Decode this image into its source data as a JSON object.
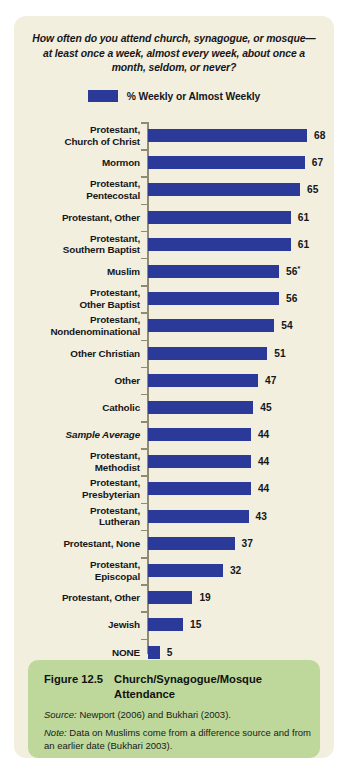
{
  "figure": {
    "question_title": "How often do you attend church, synagogue, or mosque—at least once a week, almost every week, about once a month, seldom, or never?",
    "legend_label": "% Weekly or Almost Weekly",
    "caption_number": "Figure 12.5",
    "caption_title": "Church/Synagogue/Mosque Attendance",
    "source_label": "Source:",
    "source_text": " Newport (2006) and Bukhari (2003).",
    "note_label": "Note:",
    "note_text": " Data on Muslims come from a difference source and from an earlier date (Bukhari 2003)."
  },
  "colors": {
    "bar": "#2b3a99",
    "card_background": "#f2efdf",
    "caption_background": "#bdd89a",
    "axis": "#8e8a73",
    "text": "#16161a"
  },
  "chart_data": {
    "type": "bar",
    "orientation": "horizontal",
    "title": "How often do you attend church, synagogue, or mosque—at least once a week, almost every week, about once a month, seldom, or never?",
    "xlabel": "",
    "ylabel": "",
    "xlim": [
      0,
      70
    ],
    "grid": false,
    "legend_position": "top-center",
    "series": [
      {
        "name": "% Weekly or Almost Weekly",
        "color": "#2b3a99",
        "values": [
          68,
          67,
          65,
          61,
          61,
          56,
          56,
          54,
          51,
          47,
          45,
          44,
          44,
          44,
          43,
          37,
          32,
          19,
          15,
          5
        ]
      }
    ],
    "categories": [
      "Protestant, Church of Christ",
      "Mormon",
      "Protestant, Pentecostal",
      "Protestant, Other",
      "Protestant, Southern Baptist",
      "Muslim",
      "Protestant, Other Baptist",
      "Protestant, Nondenominational",
      "Other Christian",
      "Other",
      "Catholic",
      "Sample Average",
      "Protestant, Methodist",
      "Protestant, Presbyterian",
      "Protestant, Lutheran",
      "Protestant, None",
      "Protestant, Episcopal",
      "Protestant, Other",
      "Jewish",
      "NONE"
    ],
    "rows": [
      {
        "label_line1": "Protestant,",
        "label_line2": "Church of Christ",
        "value": 68,
        "value_text": "68",
        "footnote": "",
        "italic": false
      },
      {
        "label_line1": "Mormon",
        "label_line2": "",
        "value": 67,
        "value_text": "67",
        "footnote": "",
        "italic": false
      },
      {
        "label_line1": "Protestant,",
        "label_line2": "Pentecostal",
        "value": 65,
        "value_text": "65",
        "footnote": "",
        "italic": false
      },
      {
        "label_line1": "Protestant, Other",
        "label_line2": "",
        "value": 61,
        "value_text": "61",
        "footnote": "",
        "italic": false
      },
      {
        "label_line1": "Protestant,",
        "label_line2": "Southern Baptist",
        "value": 61,
        "value_text": "61",
        "footnote": "",
        "italic": false
      },
      {
        "label_line1": "Muslim",
        "label_line2": "",
        "value": 56,
        "value_text": "56",
        "footnote": "*",
        "italic": false
      },
      {
        "label_line1": "Protestant,",
        "label_line2": "Other Baptist",
        "value": 56,
        "value_text": "56",
        "footnote": "",
        "italic": false
      },
      {
        "label_line1": "Protestant,",
        "label_line2": "Nondenominational",
        "value": 54,
        "value_text": "54",
        "footnote": "",
        "italic": false
      },
      {
        "label_line1": "Other Christian",
        "label_line2": "",
        "value": 51,
        "value_text": "51",
        "footnote": "",
        "italic": false
      },
      {
        "label_line1": "Other",
        "label_line2": "",
        "value": 47,
        "value_text": "47",
        "footnote": "",
        "italic": false
      },
      {
        "label_line1": "Catholic",
        "label_line2": "",
        "value": 45,
        "value_text": "45",
        "footnote": "",
        "italic": false
      },
      {
        "label_line1": "Sample Average",
        "label_line2": "",
        "value": 44,
        "value_text": "44",
        "footnote": "",
        "italic": true
      },
      {
        "label_line1": "Protestant,",
        "label_line2": "Methodist",
        "value": 44,
        "value_text": "44",
        "footnote": "",
        "italic": false
      },
      {
        "label_line1": "Protestant,",
        "label_line2": "Presbyterian",
        "value": 44,
        "value_text": "44",
        "footnote": "",
        "italic": false
      },
      {
        "label_line1": "Protestant,",
        "label_line2": "Lutheran",
        "value": 43,
        "value_text": "43",
        "footnote": "",
        "italic": false
      },
      {
        "label_line1": "Protestant, None",
        "label_line2": "",
        "value": 37,
        "value_text": "37",
        "footnote": "",
        "italic": false
      },
      {
        "label_line1": "Protestant,",
        "label_line2": "Episcopal",
        "value": 32,
        "value_text": "32",
        "footnote": "",
        "italic": false
      },
      {
        "label_line1": "Protestant, Other",
        "label_line2": "",
        "value": 19,
        "value_text": "19",
        "footnote": "",
        "italic": false
      },
      {
        "label_line1": "Jewish",
        "label_line2": "",
        "value": 15,
        "value_text": "15",
        "footnote": "",
        "italic": false
      },
      {
        "label_line1": "NONE",
        "label_line2": "",
        "value": 5,
        "value_text": "5",
        "footnote": "",
        "italic": false
      }
    ]
  }
}
